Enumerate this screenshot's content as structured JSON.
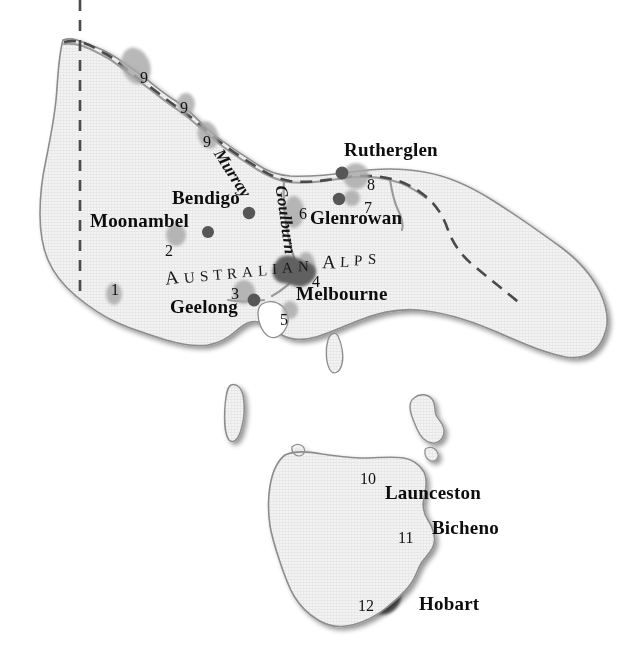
{
  "map": {
    "title": "Victoria and Tasmania wine regions reference map",
    "colors": {
      "land_fill": "#f2f2f2",
      "land_stroke": "#8d8d8d",
      "coast_shadow": "#b8b8b8",
      "border_dash": "#4a4a4a",
      "river": "#9a9a9a",
      "marker_dot": "#5a5a5a",
      "region_blob": "#a8a8a8",
      "city_blob": "#666666",
      "text": "#0d0d0d",
      "background": "#ffffff"
    },
    "cities": [
      {
        "name": "Rutherglen",
        "x": 344,
        "y": 140,
        "size": 19
      },
      {
        "name": "Bendigo",
        "x": 172,
        "y": 188,
        "size": 19
      },
      {
        "name": "Glenrowan",
        "x": 310,
        "y": 208,
        "size": 19
      },
      {
        "name": "Moonambel",
        "x": 90,
        "y": 211,
        "size": 19
      },
      {
        "name": "Melbourne",
        "x": 296,
        "y": 284,
        "size": 19
      },
      {
        "name": "Geelong",
        "x": 170,
        "y": 297,
        "size": 19
      },
      {
        "name": "Launceston",
        "x": 385,
        "y": 483,
        "size": 19
      },
      {
        "name": "Bicheno",
        "x": 432,
        "y": 518,
        "size": 19
      },
      {
        "name": "Hobart",
        "x": 419,
        "y": 594,
        "size": 19
      }
    ],
    "numbered_markers": [
      {
        "n": "1",
        "x": 111,
        "y": 282,
        "size": 16
      },
      {
        "n": "2",
        "x": 165,
        "y": 243,
        "size": 16
      },
      {
        "n": "3",
        "x": 231,
        "y": 286,
        "size": 16
      },
      {
        "n": "4",
        "x": 312,
        "y": 274,
        "size": 16
      },
      {
        "n": "5",
        "x": 280,
        "y": 312,
        "size": 16
      },
      {
        "n": "6",
        "x": 299,
        "y": 206,
        "size": 16
      },
      {
        "n": "7",
        "x": 364,
        "y": 200,
        "size": 16
      },
      {
        "n": "8",
        "x": 367,
        "y": 177,
        "size": 16
      },
      {
        "n": "9",
        "x": 140,
        "y": 70,
        "size": 16
      },
      {
        "n": "9",
        "x": 180,
        "y": 100,
        "size": 16
      },
      {
        "n": "9",
        "x": 203,
        "y": 134,
        "size": 16
      },
      {
        "n": "10",
        "x": 360,
        "y": 471,
        "size": 16
      },
      {
        "n": "11",
        "x": 398,
        "y": 530,
        "size": 16
      },
      {
        "n": "12",
        "x": 358,
        "y": 598,
        "size": 16
      }
    ],
    "rivers": [
      {
        "name": "Murray",
        "x": 218,
        "y": 142,
        "rotate": 57,
        "size": 17
      },
      {
        "name": "Goulburn",
        "x": 281,
        "y": 177,
        "rotate": 82,
        "size": 17
      }
    ],
    "ranges": [
      {
        "name": "AUSTRALIAN ALPS",
        "x": 165,
        "y": 268,
        "size": 15
      }
    ],
    "islands": [
      {
        "name": "King Island"
      },
      {
        "name": "Flinders Island"
      },
      {
        "name": "Tasmania"
      }
    ],
    "features": {
      "state_border_vertical": true,
      "state_border_dashed": true,
      "grid_texture": true
    }
  }
}
